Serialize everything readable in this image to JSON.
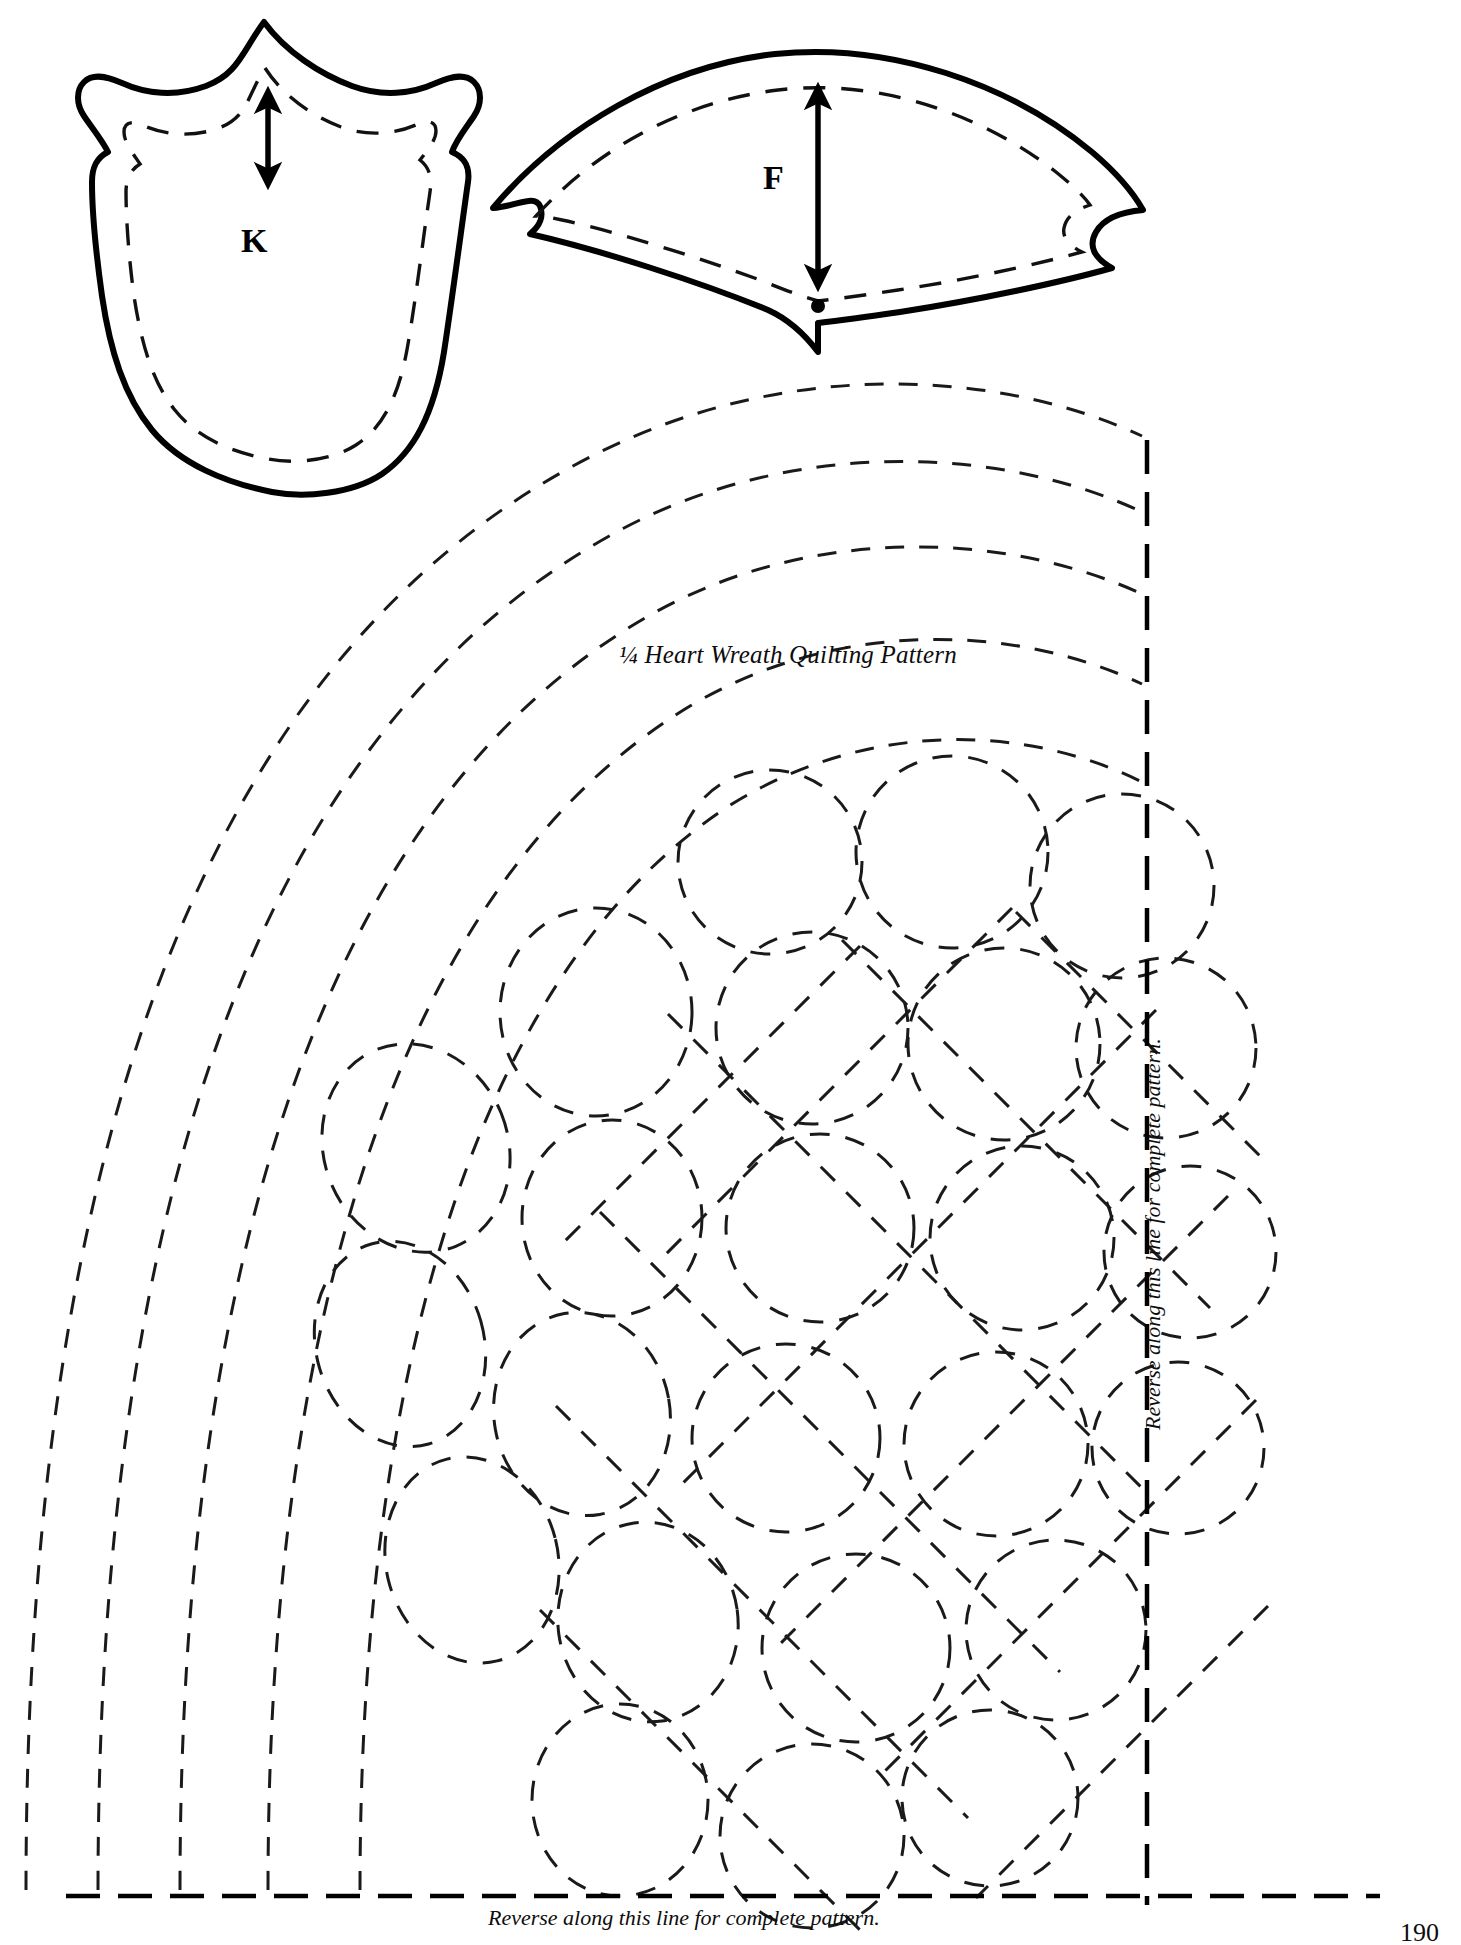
{
  "page": {
    "width": 1461,
    "height": 1937,
    "background_color": "#ffffff",
    "ink_color": "#000000",
    "page_number": "190",
    "document_type": "quilt pattern template page"
  },
  "templates": [
    {
      "id": "K",
      "label": "K",
      "shape_name": "tulip-petal-template",
      "description": "Tulip / scalloped petal appliqué template with seam allowance shown as dashed stitching line and a double-headed grainline arrow",
      "grainline_arrow": "double-headed-vertical",
      "outline_style": "solid",
      "stitch_line_style": "dashed"
    },
    {
      "id": "F",
      "label": "F",
      "shape_name": "fan-wedge-template",
      "description": "Curved fan / wedge appliqué template with dashed seam line, double-headed grainline arrow and a registration dot at the lower point",
      "grainline_arrow": "double-headed-vertical",
      "outline_style": "solid",
      "stitch_line_style": "dashed",
      "registration_dot": true
    }
  ],
  "quilting_pattern": {
    "title": "¼ Heart Wreath Quilting Pattern",
    "style": "dashed quilting stitch lines",
    "elements": [
      "concentric heart-wreath arcs",
      "overlapping circular loops",
      "diagonal crosshatch grid"
    ]
  },
  "fold_notes": {
    "right_edge": "Reverse along this line for complete pattern.",
    "bottom_edge": "Reverse along this line for complete pattern."
  },
  "colors": {
    "ink": "#000000",
    "paper": "#ffffff",
    "dash_ink": "#1a1a1a"
  }
}
